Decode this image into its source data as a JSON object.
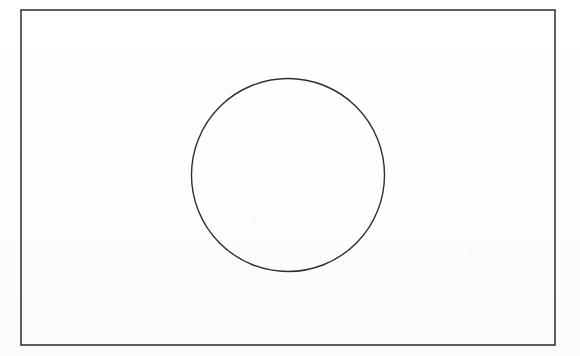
{
  "document": {
    "title": "Geometric line figure",
    "description": "A rectangular frame containing a single inscribed circle",
    "background_color": "#fdfdfd",
    "canvas": {
      "width": 580,
      "height": 356
    }
  },
  "figure": {
    "kind": "line-drawing",
    "stroke_color": "#2b2b2b",
    "fill": "none",
    "shapes": [
      {
        "id": "frame-rectangle",
        "type": "rectangle",
        "label": "Outer rectangle frame",
        "x": 21,
        "y": 10,
        "width": 534,
        "height": 335,
        "stroke_width": 1.5,
        "stroke_color": "#2b2b2b",
        "fill": "none"
      },
      {
        "id": "inscribed-circle",
        "type": "circle",
        "label": "Inscribed circle",
        "cx": 288,
        "cy": 175,
        "r": 96.5,
        "stroke_width": 1.4,
        "stroke_color": "#2f2f2f",
        "fill": "none"
      }
    ]
  }
}
